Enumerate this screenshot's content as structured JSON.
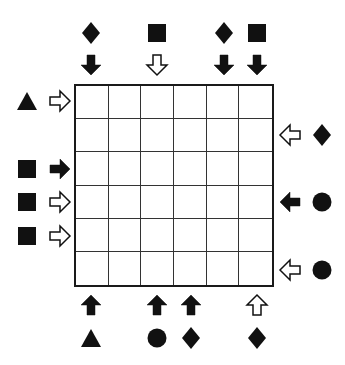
{
  "puzzle": {
    "rows": 6,
    "cols": 6,
    "grid_color": "#1a1a1a",
    "shape_color": "#111111",
    "clues": {
      "top": [
        {
          "col": 1,
          "symbol": "diamond",
          "arrow": "down",
          "arrow_fill": "black"
        },
        {
          "col": 3,
          "symbol": "square",
          "arrow": "down",
          "arrow_fill": "white"
        },
        {
          "col": 5,
          "symbol": "diamond",
          "arrow": "down",
          "arrow_fill": "black"
        },
        {
          "col": 6,
          "symbol": "square",
          "arrow": "down",
          "arrow_fill": "black"
        }
      ],
      "left": [
        {
          "row": 1,
          "symbol": "triangle",
          "arrow": "right",
          "arrow_fill": "white"
        },
        {
          "row": 3,
          "symbol": "square",
          "arrow": "right",
          "arrow_fill": "black"
        },
        {
          "row": 4,
          "symbol": "square",
          "arrow": "right",
          "arrow_fill": "white"
        },
        {
          "row": 5,
          "symbol": "square",
          "arrow": "right",
          "arrow_fill": "white"
        }
      ],
      "right": [
        {
          "row": 2,
          "symbol": "diamond",
          "arrow": "left",
          "arrow_fill": "white"
        },
        {
          "row": 4,
          "symbol": "circle",
          "arrow": "left",
          "arrow_fill": "black"
        },
        {
          "row": 6,
          "symbol": "circle",
          "arrow": "left",
          "arrow_fill": "white"
        }
      ],
      "bottom": [
        {
          "col": 1,
          "symbol": "triangle",
          "arrow": "up",
          "arrow_fill": "black"
        },
        {
          "col": 3,
          "symbol": "circle",
          "arrow": "up",
          "arrow_fill": "black"
        },
        {
          "col": 4,
          "symbol": "diamond",
          "arrow": "up",
          "arrow_fill": "black"
        },
        {
          "col": 6,
          "symbol": "diamond",
          "arrow": "up",
          "arrow_fill": "white"
        }
      ]
    }
  }
}
